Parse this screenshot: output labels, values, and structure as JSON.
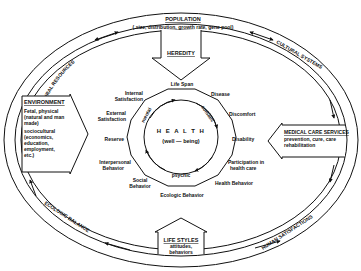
{
  "diagram": {
    "type": "health-ecology-model",
    "outer_ring": {
      "top": {
        "title": "POPULATION",
        "subtitle": "( size, distribution, growth rate, gene pool)"
      },
      "upper_left": "NATURAL RESOURCES",
      "upper_right": "CULTURAL SYSTEMS",
      "lower_left": "ECOLOGIC BALANCE",
      "lower_right": "HUMAN SATISFACTIONS"
    },
    "inputs": {
      "heredity": {
        "title": "HEREDITY"
      },
      "environment": {
        "title": "ENVIRONMENT",
        "lines": [
          "Fetal, physical",
          "(natural and man",
          "made)",
          "sociocultural",
          "(economics,",
          "education,",
          "employment,",
          "etc.)"
        ]
      },
      "medical_care": {
        "title": "MEDICAL CARE SERVICES",
        "lines": [
          "prevention, cure, care",
          "rehabilitation"
        ]
      },
      "life_styles": {
        "title": "LIFE STYLES",
        "lines": [
          "attitudes,",
          "behaviors"
        ]
      }
    },
    "center": {
      "title": "H E A L T H",
      "subtitle": "(well — being)",
      "arrow_labels": {
        "mental": "mental",
        "somatic": "somatic",
        "psychic": "psychic"
      }
    },
    "health_dimensions": {
      "life_span": "Life Span",
      "disease": "Disease",
      "discomfort": "Discomfort",
      "disability": "Disability",
      "participation_1": "Participation in",
      "participation_2": "health care",
      "health_behavior": "Health Behavior",
      "ecologic_behavior": "Ecologic Behavior",
      "social_behavior_1": "Social",
      "social_behavior_2": "Behavior",
      "interpersonal_1": "Interpersonal",
      "interpersonal_2": "Behavior",
      "reserve": "Reserve",
      "external_1": "External",
      "external_2": "Satisfaction",
      "internal_1": "Internal",
      "internal_2": "Satisfaction"
    }
  }
}
